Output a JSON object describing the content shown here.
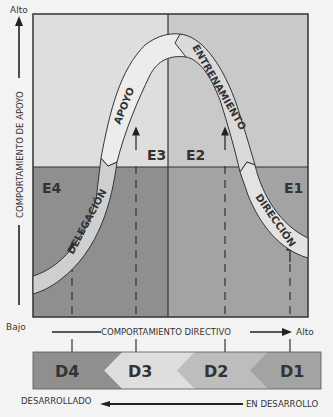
{
  "y_axis": {
    "high_label": "Alto",
    "low_label": "Bajo",
    "title": "COMPORTAMIENTO DE APOYO"
  },
  "x_axis": {
    "title": "COMPORTAMIENTO DIRECTIVO",
    "high_label": "Alto"
  },
  "quadrants": [
    {
      "id": "E1",
      "label": "E1",
      "color": "#a3a3a3"
    },
    {
      "id": "E2",
      "label": "E2",
      "color": "#c9c9c9"
    },
    {
      "id": "E3",
      "label": "E3",
      "color": "#dedede"
    },
    {
      "id": "E4",
      "label": "E4",
      "color": "#8f8f8f"
    }
  ],
  "curve_segments": [
    {
      "label": "DELEGACIÓN",
      "color": "#cfcfcf"
    },
    {
      "label": "APOYO",
      "color": "#ececec"
    },
    {
      "label": "ENTRENAMIENTO",
      "color": "#dadada"
    },
    {
      "label": "DIRECCIÓN",
      "color": "#e3e3e3"
    }
  ],
  "development_levels": [
    {
      "label": "D4",
      "color": "#8f8f8f"
    },
    {
      "label": "D3",
      "color": "#dedede"
    },
    {
      "label": "D2",
      "color": "#bdbdbd"
    },
    {
      "label": "D1",
      "color": "#a3a3a3"
    }
  ],
  "development_axis": {
    "left_label": "DESARROLLADO",
    "right_label": "EN DESARROLLO"
  }
}
